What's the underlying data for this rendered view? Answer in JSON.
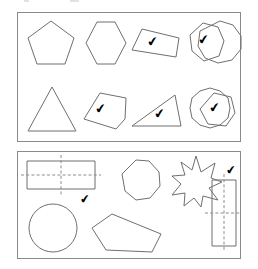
{
  "worksheet": {
    "title": "Geometry shapes worksheet — symmetry check",
    "check_mark": "✔",
    "stroke_color": "#6f6f6f",
    "dash_color": "#8c8c8c",
    "border_color": "#8a8a8a",
    "mark_color": "#000000"
  },
  "panels": [
    {
      "id": "panel-top",
      "name": "top-panel",
      "rows": [
        {
          "name": "row-1",
          "shapes": [
            {
              "name": "pentagon",
              "type": "pentagon",
              "sides": 5,
              "checked": false,
              "label": "regular pentagon"
            },
            {
              "name": "hexagon",
              "type": "hexagon",
              "sides": 6,
              "checked": false,
              "label": "regular hexagon"
            },
            {
              "name": "irregular-quadrilateral-1",
              "type": "irregular-quadrilateral",
              "sides": 4,
              "checked": true,
              "label": "irregular quadrilateral"
            },
            {
              "name": "irregular-heptagon",
              "type": "irregular-polygon",
              "sides": 7,
              "checked": true,
              "label": "irregular blob polygon"
            },
            {
              "name": "nonagon",
              "type": "nonagon",
              "sides": 9,
              "checked": false,
              "label": "regular nonagon"
            }
          ]
        },
        {
          "name": "row-2",
          "shapes": [
            {
              "name": "triangle-isosceles",
              "type": "triangle",
              "sides": 3,
              "checked": false,
              "label": "isosceles triangle"
            },
            {
              "name": "irregular-pentagon-1",
              "type": "irregular-pentagon",
              "sides": 5,
              "checked": true,
              "label": "irregular pentagon"
            },
            {
              "name": "right-triangle",
              "type": "triangle",
              "sides": 3,
              "checked": true,
              "label": "scalene right triangle"
            },
            {
              "name": "decagon",
              "type": "decagon",
              "sides": 10,
              "checked": false,
              "label": "regular decagon"
            },
            {
              "name": "irregular-pentagon-2",
              "type": "irregular-pentagon",
              "sides": 5,
              "checked": true,
              "label": "irregular rounded polygon"
            }
          ]
        }
      ]
    },
    {
      "id": "panel-bottom",
      "name": "bottom-panel",
      "rows": [
        {
          "name": "row-1",
          "shapes": [
            {
              "name": "rectangle-horizontal",
              "type": "rectangle",
              "sides": 4,
              "checked": true,
              "symmetry_lines": [
                "horizontal",
                "vertical"
              ],
              "label": "horizontal rectangle with symmetry lines"
            },
            {
              "name": "octagon",
              "type": "octagon",
              "sides": 8,
              "checked": false,
              "label": "regular octagon"
            },
            {
              "name": "star-9-point",
              "type": "star",
              "points": 9,
              "checked": false,
              "label": "nine pointed star"
            },
            {
              "name": "rectangle-vertical",
              "type": "rectangle",
              "sides": 4,
              "checked": true,
              "symmetry_lines": [
                "vertical",
                "horizontal"
              ],
              "label": "vertical rectangle with symmetry lines"
            }
          ]
        },
        {
          "name": "row-2",
          "shapes": [
            {
              "name": "circle",
              "type": "circle",
              "sides": 0,
              "checked": false,
              "label": "circle"
            },
            {
              "name": "irregular-pentagon-3",
              "type": "irregular-pentagon",
              "sides": 5,
              "checked": false,
              "label": "irregular pentagon"
            }
          ]
        }
      ]
    }
  ]
}
